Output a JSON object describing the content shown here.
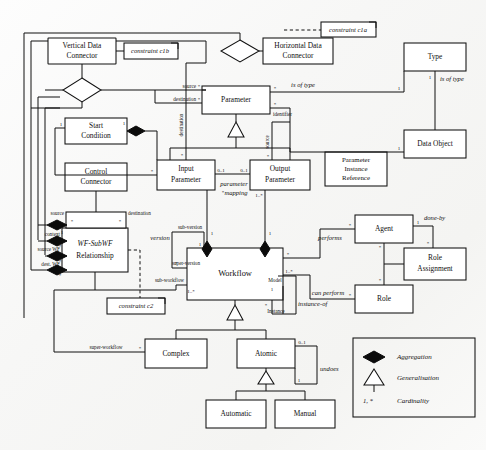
{
  "diagram": {
    "kind": "uml-class-diagram",
    "ink_color": "#111111",
    "paper_color": "#fbfbfa"
  },
  "classes": [
    {
      "id": "vertical-data-connector",
      "label_lines": [
        "Vertical Data",
        "Connector"
      ]
    },
    {
      "id": "horizontal-data-connector",
      "label_lines": [
        "Horizontal Data",
        "Connector"
      ]
    },
    {
      "id": "type",
      "label_lines": [
        "Type"
      ]
    },
    {
      "id": "data-object",
      "label_lines": [
        "Data Object"
      ]
    },
    {
      "id": "parameter-instance-reference",
      "label_lines": [
        "Parameter",
        "Instance",
        "Reference"
      ]
    },
    {
      "id": "parameter",
      "label_lines": [
        "Parameter"
      ]
    },
    {
      "id": "start-condition",
      "label_lines": [
        "Start",
        "Condition"
      ]
    },
    {
      "id": "control-connector",
      "label_lines": [
        "Control",
        "Connector"
      ]
    },
    {
      "id": "wf-subwf-relationship",
      "label_lines": [
        "WF-SubWF",
        "Relationship"
      ],
      "italic_first": true
    },
    {
      "id": "input-parameter",
      "label_lines": [
        "Input",
        "Parameter"
      ]
    },
    {
      "id": "output-parameter",
      "label_lines": [
        "Output",
        "Parameter"
      ]
    },
    {
      "id": "workflow",
      "label_lines": [
        "Workflow"
      ]
    },
    {
      "id": "agent",
      "label_lines": [
        "Agent"
      ]
    },
    {
      "id": "role-assignment",
      "label_lines": [
        "Role",
        "Assignment"
      ]
    },
    {
      "id": "role",
      "label_lines": [
        "Role"
      ]
    },
    {
      "id": "complex",
      "label_lines": [
        "Complex"
      ]
    },
    {
      "id": "atomic",
      "label_lines": [
        "Atomic"
      ]
    },
    {
      "id": "automatic",
      "label_lines": [
        "Automatic"
      ]
    },
    {
      "id": "manual",
      "label_lines": [
        "Manual"
      ]
    }
  ],
  "constraints": [
    {
      "id": "c1a",
      "label": "constraint c1a",
      "attached_to": "horizontal-data-connector"
    },
    {
      "id": "c1b",
      "label": "constraint c1b",
      "attached_to": "vertical-data-connector"
    },
    {
      "id": "c2",
      "label": "constraint c2",
      "attached_to": "wf-subwf-relationship"
    }
  ],
  "association_names": {
    "is_of_type_parameter": "is of type",
    "is_of_type_type_dataobject": "is of type",
    "parameter_mapping_line1": "parameter",
    "parameter_mapping_line2": "mapping",
    "performs": "performs",
    "can_perform": "can perform",
    "done_by": "done-by",
    "instance_of": "instance-of",
    "undoes": "undoes",
    "version": "version"
  },
  "role_labels": {
    "source": "source",
    "destination": "destination",
    "destination_vertical": "destination",
    "source_vertical": "source",
    "identifier": "identifier",
    "context": "context",
    "source_wf": "source WF",
    "dest_wf": "dest. WF",
    "cc_source": "source",
    "cc_destination": "destination",
    "sub_version": "sub-version",
    "super_version": "super-version",
    "sub_workflow": "sub-workflow",
    "super_workflow": "super-workflow",
    "model": "Model",
    "instance": "Instance"
  },
  "cardinalities": {
    "star": "*",
    "one": "1",
    "zero_one": "0..1",
    "one_star": "1..*"
  },
  "legend": {
    "title": "",
    "items": [
      {
        "symbol": "filled-diamond",
        "label": "Aggregation"
      },
      {
        "symbol": "hollow-triangle",
        "label": "Generalisation"
      },
      {
        "symbol": "cardinality-text",
        "symbol_text": "1,  *",
        "label": "Cardinality"
      }
    ]
  }
}
